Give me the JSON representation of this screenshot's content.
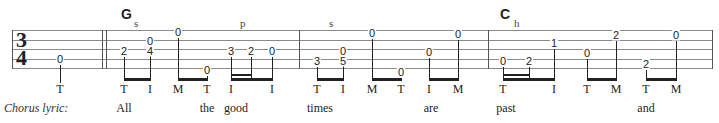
{
  "time_signature": {
    "top": "3",
    "bottom": "4"
  },
  "chords": [
    {
      "name": "G",
      "x": 121
    },
    {
      "name": "C",
      "x": 500
    }
  ],
  "techniques": [
    {
      "label": "s",
      "x": 134
    },
    {
      "label": "p",
      "x": 240
    },
    {
      "label": "s",
      "x": 329
    },
    {
      "label": "h",
      "x": 514
    }
  ],
  "strings_y": [
    30,
    40,
    49,
    59,
    68
  ],
  "barlines_x": [
    12,
    102,
    106,
    299,
    488,
    712
  ],
  "notes": [
    {
      "x": 60,
      "frets": [
        {
          "f": "0",
          "y": 59
        }
      ],
      "finger": "T"
    },
    {
      "x": 124,
      "frets": [
        {
          "f": "2",
          "y": 51
        }
      ],
      "finger": "T"
    },
    {
      "x": 150,
      "frets": [
        {
          "f": "0",
          "y": 41
        },
        {
          "f": "4",
          "y": 51
        }
      ],
      "finger": "I"
    },
    {
      "x": 178,
      "frets": [
        {
          "f": "0",
          "y": 32
        }
      ],
      "finger": "M"
    },
    {
      "x": 207,
      "frets": [
        {
          "f": "0",
          "y": 70
        }
      ],
      "finger": "T"
    },
    {
      "x": 231,
      "frets": [
        {
          "f": "3",
          "y": 51
        }
      ],
      "finger": "I"
    },
    {
      "x": 251,
      "frets": [
        {
          "f": "2",
          "y": 51
        }
      ],
      "finger": ""
    },
    {
      "x": 272,
      "frets": [
        {
          "f": "0",
          "y": 51
        }
      ],
      "finger": "I"
    },
    {
      "x": 317,
      "frets": [
        {
          "f": "3",
          "y": 61
        }
      ],
      "finger": "T"
    },
    {
      "x": 343,
      "frets": [
        {
          "f": "0",
          "y": 51
        },
        {
          "f": "5",
          "y": 61
        }
      ],
      "finger": "I"
    },
    {
      "x": 372,
      "frets": [
        {
          "f": "0",
          "y": 33
        }
      ],
      "finger": "M"
    },
    {
      "x": 401,
      "frets": [
        {
          "f": "0",
          "y": 72
        }
      ],
      "finger": "T"
    },
    {
      "x": 429,
      "frets": [
        {
          "f": "0",
          "y": 52
        }
      ],
      "finger": "I"
    },
    {
      "x": 458,
      "frets": [
        {
          "f": "0",
          "y": 34
        }
      ],
      "finger": "M"
    },
    {
      "x": 503,
      "frets": [
        {
          "f": "0",
          "y": 61
        }
      ],
      "finger": "T"
    },
    {
      "x": 529,
      "frets": [
        {
          "f": "2",
          "y": 61
        }
      ],
      "finger": ""
    },
    {
      "x": 554,
      "frets": [
        {
          "f": "1",
          "y": 43
        }
      ],
      "finger": "I"
    },
    {
      "x": 587,
      "frets": [
        {
          "f": "0",
          "y": 53
        }
      ],
      "finger": "T"
    },
    {
      "x": 616,
      "frets": [
        {
          "f": "2",
          "y": 35
        }
      ],
      "finger": "M"
    },
    {
      "x": 646,
      "frets": [
        {
          "f": "2",
          "y": 64
        }
      ],
      "finger": "T"
    },
    {
      "x": 676,
      "frets": [
        {
          "f": "0",
          "y": 35
        }
      ],
      "finger": "M"
    }
  ],
  "lyric_label": "Chorus lyric:",
  "lyrics": [
    {
      "word": "All",
      "x": 124
    },
    {
      "word": "the",
      "x": 207
    },
    {
      "word": "good",
      "x": 236
    },
    {
      "word": "times",
      "x": 320
    },
    {
      "word": "are",
      "x": 431
    },
    {
      "word": "past",
      "x": 506
    },
    {
      "word": "and",
      "x": 646
    }
  ]
}
